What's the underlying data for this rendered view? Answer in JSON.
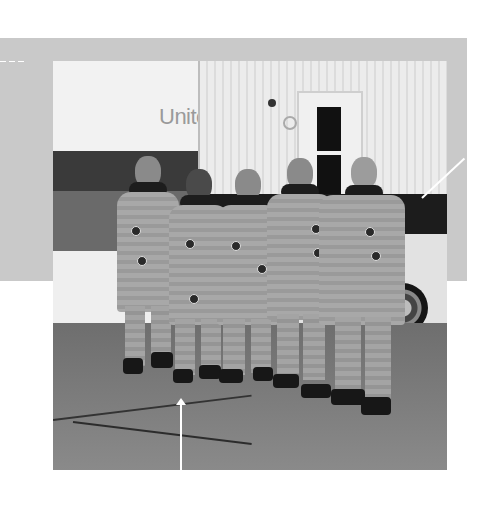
{
  "figure": {
    "sign_text": "Unite",
    "astronaut_count": 5,
    "annotations": {
      "overlay_box_color": "#c9c9c9",
      "leader_line_color": "#ffffff",
      "right_leader": "diagonal-callout-line",
      "bottom_arrow": "up-arrow"
    }
  }
}
